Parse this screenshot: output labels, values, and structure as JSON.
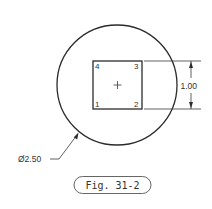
{
  "drawing": {
    "circle_diameter_label": "Ø2.50",
    "square_dimension_label": "1.00",
    "corner_labels": [
      "1",
      "2",
      "3",
      "4"
    ],
    "center_mark": "+",
    "caption": "Fig. 31-2"
  },
  "colors": {
    "line": "#2b2b2b",
    "text": "#333333",
    "background": "#ffffff"
  }
}
